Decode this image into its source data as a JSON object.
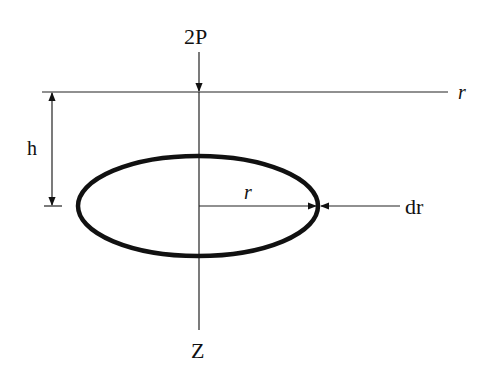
{
  "diagram": {
    "labels": {
      "load": "2P",
      "depth": "h",
      "radius_axis": "r",
      "radius_arrow": "r",
      "increment": "dr",
      "vertical_axis": "Z"
    },
    "colors": {
      "stroke": "#111111",
      "background": "#ffffff"
    }
  }
}
